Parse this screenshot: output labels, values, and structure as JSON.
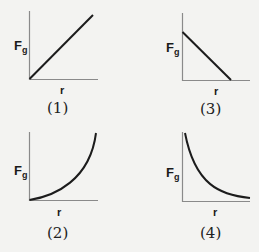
{
  "graphs": [
    {
      "id": "1",
      "caption": "(1)",
      "ylabel_main": "F",
      "ylabel_sub": "g",
      "xlabel": "r",
      "shape": "linear increasing from origin"
    },
    {
      "id": "2",
      "caption": "(2)",
      "ylabel_main": "F",
      "ylabel_sub": "g",
      "xlabel": "r",
      "shape": "curve increasing, concave up"
    },
    {
      "id": "3",
      "caption": "(3)",
      "ylabel_main": "F",
      "ylabel_sub": "g",
      "xlabel": "r",
      "shape": "linear decreasing to x-axis"
    },
    {
      "id": "4",
      "caption": "(4)",
      "ylabel_main": "F",
      "ylabel_sub": "g",
      "xlabel": "r",
      "shape": "curve decreasing, inverse relation"
    }
  ],
  "colors": {
    "axis": "#8a8a8a",
    "curve": "#1c1c1c",
    "background": "#f3f3f1"
  }
}
